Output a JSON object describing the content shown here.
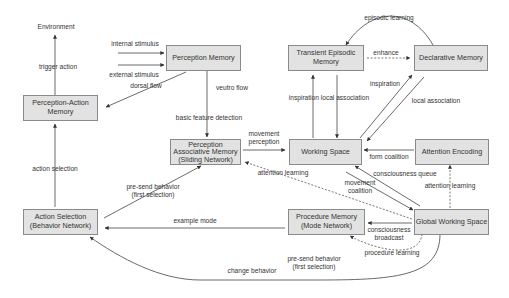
{
  "diagram": {
    "colors": {
      "node_fill": "#e2e2e2",
      "node_border": "#8a8a8a",
      "edge": "#444444",
      "text": "#333333",
      "background": "#ffffff"
    },
    "nodes": {
      "environment": "Environment",
      "perception_action_memory": "Perception-Action\nMemory",
      "perception_memory": "Perception Memory",
      "transient_episodic_memory": "Transient Episodic\nMemory",
      "declarative_memory": "Declarative Memory",
      "perception_associative_memory": "Perception\nAssociative Memory\n(Sliding Network)",
      "working_space": "Working Space",
      "attention_encoding": "Attention Encoding",
      "action_selection": "Action Selection\n(Behavior Network)",
      "procedure_memory": "Procedure Memory\n(Mode Network)",
      "global_working_space": "Global Working Space"
    },
    "edges": {
      "trigger_action": "trigger action",
      "internal_stimulus": "internal stimulus",
      "external_stimulus": "external stimulus",
      "dorsal_flow": "dorsal flow",
      "veutro_flow": "veutro flow",
      "basic_feature_detection": "basic feature detection",
      "episodic_learning": "episodic learning",
      "enhance": "enhance",
      "inspiration_local_association": "inspiration local association",
      "inspiration": "inspiration",
      "local_association": "local association",
      "movement_perception": "movement\nperception",
      "form_coalition": "form coalition",
      "action_selection": "action selection",
      "pre_send_behavior_first_selection_top": "pre-send behavior\n(first selection)",
      "attention_learning_dashed": "attention learning",
      "consciousness_queue": "consciousness queue",
      "movement_coalition": "movement\ncoalition",
      "attention_learning_right": "attention learning",
      "example_mode": "example mode",
      "consciousness_broadcast": "consciousness\nbroadcast",
      "procedure_learning": "procedure learning",
      "pre_send_behavior_first_selection_bottom": "pre-send behavior\n(first selection)",
      "change_behavior": "change behavior"
    }
  }
}
